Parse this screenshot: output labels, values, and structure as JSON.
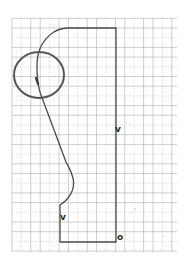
{
  "diagram": {
    "type": "profile-sketch-on-grid-paper",
    "grid": {
      "x_start": 12,
      "x_end": 177,
      "y_start": 18,
      "y_end": 252,
      "spacing_x": 9.4,
      "spacing_y": 9.7,
      "line_color": "#b9b9b9",
      "dotted_line_color": "#cfcfcf"
    },
    "shape": {
      "stroke_color": "#4a4a4a",
      "top_edge_y": 28,
      "right_edge_x": 116,
      "bottom_edge_y": 242,
      "left_base_x": 60
    },
    "highlight_circle": {
      "cx": 39,
      "cy": 75,
      "rx": 25,
      "ry": 23,
      "stroke_color": "#555555"
    },
    "labels": {
      "right_side": "v",
      "left_side": "v",
      "origin": "o"
    }
  }
}
